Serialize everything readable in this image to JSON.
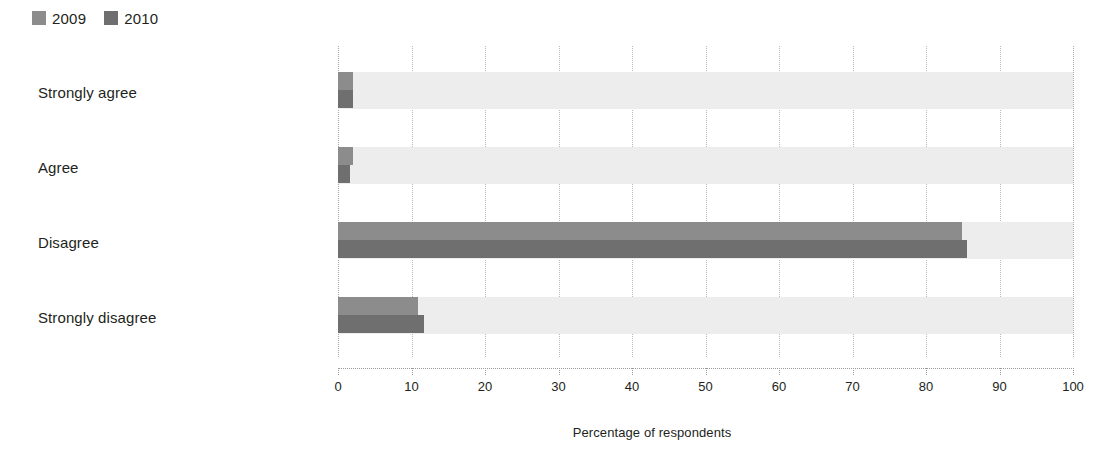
{
  "legend": {
    "entries": [
      {
        "label": "2009",
        "color": "#8c8c8c"
      },
      {
        "label": "2010",
        "color": "#6f6f6f"
      }
    ]
  },
  "axis": {
    "x_title": "Percentage of respondents",
    "ticks": [
      "0",
      "10",
      "20",
      "30",
      "40",
      "50",
      "60",
      "70",
      "80",
      "90",
      "100"
    ]
  },
  "categories": [
    "Strongly agree",
    "Agree",
    "Disagree",
    "Strongly disagree"
  ],
  "chart_data": {
    "type": "bar",
    "orientation": "horizontal",
    "title": "",
    "xlabel": "Percentage of respondents",
    "ylabel": "",
    "xlim": [
      0,
      100
    ],
    "xticks": [
      0,
      10,
      20,
      30,
      40,
      50,
      60,
      70,
      80,
      90,
      100
    ],
    "grid": true,
    "legend_position": "top-left",
    "categories": [
      "Strongly agree",
      "Agree",
      "Disagree",
      "Strongly disagree"
    ],
    "series": [
      {
        "name": "2009",
        "color": "#8c8c8c",
        "values": [
          2.0,
          2.0,
          84.9,
          10.9
        ]
      },
      {
        "name": "2010",
        "color": "#6f6f6f",
        "values": [
          2.0,
          1.7,
          85.6,
          11.7
        ]
      }
    ]
  }
}
